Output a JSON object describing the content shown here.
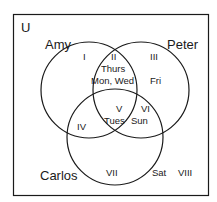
{
  "diagram": {
    "type": "venn",
    "universe_label": "U",
    "sets": [
      {
        "name": "Amy"
      },
      {
        "name": "Peter"
      },
      {
        "name": "Carlos"
      }
    ],
    "regions": [
      {
        "numeral": "I",
        "items": ""
      },
      {
        "numeral": "II",
        "items_line1": "Thurs",
        "items_line2": "Mon, Wed"
      },
      {
        "numeral": "III",
        "items": "Fri"
      },
      {
        "numeral": "IV",
        "items": ""
      },
      {
        "numeral": "V",
        "items": "Tues"
      },
      {
        "numeral": "VI",
        "items": "Sun"
      },
      {
        "numeral": "VII",
        "items": ""
      },
      {
        "numeral": "VIII",
        "items": ""
      }
    ],
    "outside_items": "Sat",
    "stroke_color": "#1a1a1a",
    "background": "#ffffff"
  }
}
